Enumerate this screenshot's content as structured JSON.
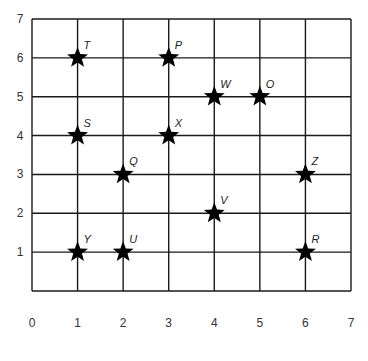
{
  "chart_data": {
    "type": "scatter",
    "title": "",
    "xlabel": "",
    "ylabel": "",
    "xlim": [
      0,
      7
    ],
    "ylim": [
      0,
      7
    ],
    "grid": true,
    "x_ticks": [
      "0",
      "1",
      "2",
      "3",
      "4",
      "5",
      "6",
      "7"
    ],
    "y_ticks": [
      "1",
      "2",
      "3",
      "4",
      "5",
      "6",
      "7"
    ],
    "marker": "star",
    "marker_color": "#000000",
    "line_color": "#1a1a1a",
    "points": [
      {
        "label": "T",
        "x": 1,
        "y": 6
      },
      {
        "label": "P",
        "x": 3,
        "y": 6
      },
      {
        "label": "W",
        "x": 4,
        "y": 5
      },
      {
        "label": "O",
        "x": 5,
        "y": 5
      },
      {
        "label": "S",
        "x": 1,
        "y": 4
      },
      {
        "label": "X",
        "x": 3,
        "y": 4
      },
      {
        "label": "Q",
        "x": 2,
        "y": 3
      },
      {
        "label": "Z",
        "x": 6,
        "y": 3
      },
      {
        "label": "V",
        "x": 4,
        "y": 2
      },
      {
        "label": "Y",
        "x": 1,
        "y": 1
      },
      {
        "label": "U",
        "x": 2,
        "y": 1
      },
      {
        "label": "R",
        "x": 6,
        "y": 1
      }
    ]
  }
}
